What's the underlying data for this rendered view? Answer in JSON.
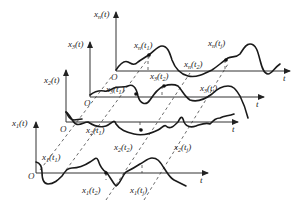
{
  "diagram": {
    "title": "",
    "colors": {
      "line": "#1a1a1a",
      "axis": "#333333",
      "background": "#ffffff"
    },
    "origin_label": "O",
    "time_axis_label": "t",
    "layers": [
      {
        "id": "xn",
        "axis_label": "x_n(t)",
        "axis_label_main": "x",
        "axis_label_sub": "n",
        "axis_label_tail": "(t)",
        "samples": [
          {
            "main": "x",
            "sub": "n",
            "arg": "t",
            "argsub": "1"
          },
          {
            "main": "x",
            "sub": "n",
            "arg": "t",
            "argsub": "2"
          },
          {
            "main": "x",
            "sub": "n",
            "arg": "t",
            "argsub": "j"
          }
        ]
      },
      {
        "id": "x3",
        "axis_label": "x_3(t)",
        "axis_label_main": "x",
        "axis_label_sub": "3",
        "axis_label_tail": "(t)",
        "samples": [
          {
            "main": "x",
            "sub": "3",
            "arg": "t",
            "argsub": "1"
          },
          {
            "main": "x",
            "sub": "3",
            "arg": "t",
            "argsub": "2"
          },
          {
            "main": "x",
            "sub": "3",
            "arg": "t",
            "argsub": "j"
          }
        ]
      },
      {
        "id": "x2",
        "axis_label": "x_2(t)",
        "axis_label_main": "x",
        "axis_label_sub": "2",
        "axis_label_tail": "(t)",
        "samples": [
          {
            "main": "x",
            "sub": "2",
            "arg": "t",
            "argsub": "1"
          },
          {
            "main": "x",
            "sub": "2",
            "arg": "t",
            "argsub": "2"
          },
          {
            "main": "x",
            "sub": "2",
            "arg": "t",
            "argsub": "j"
          }
        ]
      },
      {
        "id": "x1",
        "axis_label": "x_1(t)",
        "axis_label_main": "x",
        "axis_label_sub": "1",
        "axis_label_tail": "(t)",
        "samples": [
          {
            "main": "x",
            "sub": "1",
            "arg": "t",
            "argsub": "1"
          },
          {
            "main": "x",
            "sub": "1",
            "arg": "t",
            "argsub": "2"
          },
          {
            "main": "x",
            "sub": "1",
            "arg": "t",
            "argsub": "j"
          }
        ]
      }
    ]
  }
}
